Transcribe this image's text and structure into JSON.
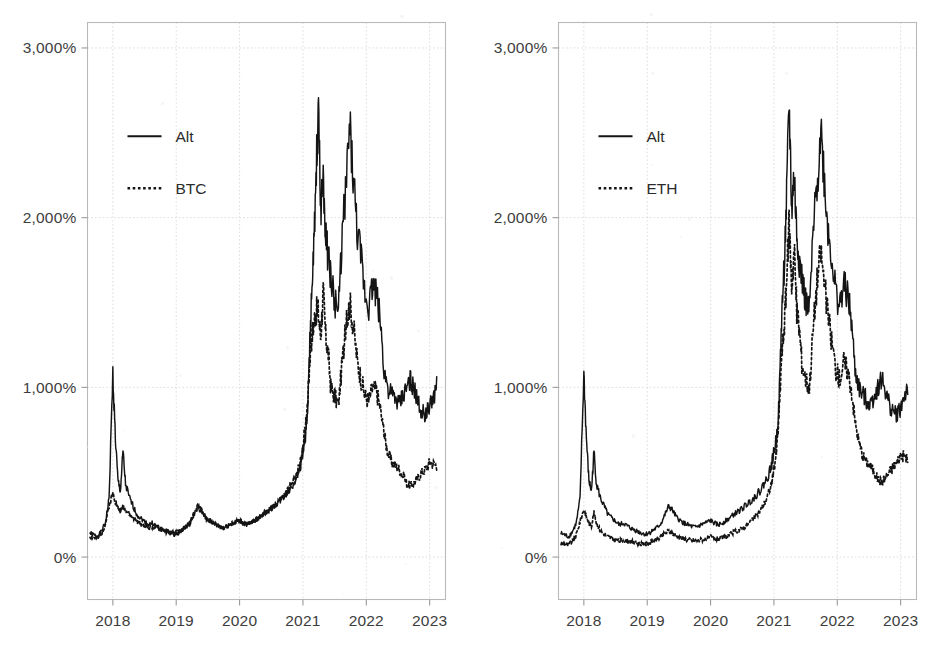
{
  "figure": {
    "background_color": "#ffffff",
    "ink_color": "#141414",
    "grid_color": "#d9d9d9",
    "axis_color": "#b9b9b9",
    "panel_count": 2
  },
  "chart_data": [
    {
      "type": "line",
      "panel": "left",
      "title": "",
      "xlabel": "",
      "ylabel": "",
      "ylim": [
        -250,
        3150
      ],
      "xlim": [
        2017.6,
        2023.25
      ],
      "grid": true,
      "legend_position": "upper-left-inside",
      "ytick_labels": [
        "0%",
        "1,000%",
        "2,000%",
        "3,000%"
      ],
      "ytick_values": [
        0,
        1000,
        2000,
        3000
      ],
      "xtick_labels": [
        "2018",
        "2019",
        "2020",
        "2021",
        "2022",
        "2023"
      ],
      "xtick_values": [
        2018,
        2019,
        2020,
        2021,
        2022,
        2023
      ],
      "legend": [
        {
          "label": "Alt",
          "style": "solid"
        },
        {
          "label": "BTC",
          "style": "dotted"
        }
      ],
      "x": [
        2017.64,
        2017.7,
        2017.76,
        2017.82,
        2017.88,
        2017.94,
        2018.0,
        2018.04,
        2018.08,
        2018.12,
        2018.16,
        2018.2,
        2018.26,
        2018.32,
        2018.38,
        2018.44,
        2018.5,
        2018.56,
        2018.62,
        2018.68,
        2018.74,
        2018.8,
        2018.86,
        2018.92,
        2018.98,
        2019.04,
        2019.1,
        2019.16,
        2019.22,
        2019.28,
        2019.34,
        2019.4,
        2019.46,
        2019.52,
        2019.58,
        2019.64,
        2019.7,
        2019.76,
        2019.82,
        2019.88,
        2019.94,
        2020.0,
        2020.06,
        2020.12,
        2020.18,
        2020.24,
        2020.3,
        2020.36,
        2020.42,
        2020.48,
        2020.54,
        2020.6,
        2020.66,
        2020.72,
        2020.78,
        2020.84,
        2020.9,
        2020.96,
        2021.0,
        2021.04,
        2021.08,
        2021.12,
        2021.16,
        2021.2,
        2021.24,
        2021.28,
        2021.32,
        2021.36,
        2021.4,
        2021.44,
        2021.5,
        2021.56,
        2021.62,
        2021.68,
        2021.74,
        2021.8,
        2021.86,
        2021.92,
        2021.98,
        2022.04,
        2022.1,
        2022.16,
        2022.22,
        2022.28,
        2022.34,
        2022.4,
        2022.46,
        2022.52,
        2022.58,
        2022.64,
        2022.7,
        2022.76,
        2022.82,
        2022.88,
        2022.94,
        2023.0,
        2023.06,
        2023.12,
        2023.18
      ],
      "series": [
        {
          "name": "Alt",
          "style": "solid",
          "values": [
            140,
            130,
            120,
            150,
            200,
            340,
            1080,
            700,
            450,
            390,
            620,
            430,
            350,
            300,
            250,
            230,
            210,
            190,
            200,
            185,
            170,
            160,
            150,
            140,
            135,
            145,
            160,
            175,
            200,
            250,
            300,
            275,
            235,
            215,
            200,
            190,
            180,
            175,
            185,
            195,
            205,
            215,
            200,
            190,
            200,
            215,
            230,
            250,
            265,
            280,
            300,
            320,
            340,
            365,
            390,
            430,
            470,
            540,
            620,
            700,
            900,
            1400,
            1700,
            2100,
            2680,
            2050,
            2250,
            1900,
            1750,
            1650,
            1500,
            1450,
            1900,
            2200,
            2530,
            2200,
            1900,
            1750,
            1550,
            1480,
            1600,
            1550,
            1400,
            1100,
            1000,
            950,
            930,
            900,
            950,
            1000,
            1050,
            980,
            900,
            860,
            840,
            880,
            950,
            1010
          ]
        },
        {
          "name": "BTC",
          "style": "dotted",
          "values": [
            120,
            115,
            110,
            140,
            190,
            300,
            380,
            330,
            290,
            270,
            300,
            280,
            250,
            230,
            210,
            195,
            185,
            175,
            180,
            170,
            165,
            155,
            150,
            145,
            140,
            150,
            165,
            180,
            205,
            255,
            295,
            270,
            235,
            215,
            200,
            190,
            180,
            175,
            185,
            195,
            205,
            215,
            200,
            190,
            200,
            215,
            230,
            250,
            265,
            280,
            300,
            325,
            345,
            370,
            400,
            440,
            490,
            570,
            660,
            760,
            950,
            1250,
            1350,
            1450,
            1450,
            1300,
            1560,
            1300,
            1200,
            1000,
            950,
            900,
            1150,
            1350,
            1500,
            1350,
            1150,
            1050,
            950,
            920,
            1000,
            980,
            880,
            720,
            620,
            560,
            540,
            520,
            480,
            430,
            420,
            440,
            470,
            500,
            520,
            560,
            550,
            540
          ]
        }
      ]
    },
    {
      "type": "line",
      "panel": "right",
      "title": "",
      "xlabel": "",
      "ylabel": "",
      "ylim": [
        -250,
        3150
      ],
      "xlim": [
        2017.6,
        2023.25
      ],
      "grid": true,
      "legend_position": "upper-left-inside",
      "ytick_labels": [
        "0%",
        "1,000%",
        "2,000%",
        "3,000%"
      ],
      "ytick_values": [
        0,
        1000,
        2000,
        3000
      ],
      "xtick_labels": [
        "2018",
        "2019",
        "2020",
        "2021",
        "2022",
        "2023"
      ],
      "xtick_values": [
        2018,
        2019,
        2020,
        2021,
        2022,
        2023
      ],
      "legend": [
        {
          "label": "Alt",
          "style": "solid"
        },
        {
          "label": "ETH",
          "style": "dotted"
        }
      ],
      "x": [
        2017.64,
        2017.7,
        2017.76,
        2017.82,
        2017.88,
        2017.94,
        2018.0,
        2018.04,
        2018.08,
        2018.12,
        2018.16,
        2018.2,
        2018.26,
        2018.32,
        2018.38,
        2018.44,
        2018.5,
        2018.56,
        2018.62,
        2018.68,
        2018.74,
        2018.8,
        2018.86,
        2018.92,
        2018.98,
        2019.04,
        2019.1,
        2019.16,
        2019.22,
        2019.28,
        2019.34,
        2019.4,
        2019.46,
        2019.52,
        2019.58,
        2019.64,
        2019.7,
        2019.76,
        2019.82,
        2019.88,
        2019.94,
        2020.0,
        2020.06,
        2020.12,
        2020.18,
        2020.24,
        2020.3,
        2020.36,
        2020.42,
        2020.48,
        2020.54,
        2020.6,
        2020.66,
        2020.72,
        2020.78,
        2020.84,
        2020.9,
        2020.96,
        2021.0,
        2021.04,
        2021.08,
        2021.12,
        2021.16,
        2021.2,
        2021.24,
        2021.28,
        2021.32,
        2021.36,
        2021.4,
        2021.44,
        2021.5,
        2021.56,
        2021.62,
        2021.68,
        2021.74,
        2021.8,
        2021.86,
        2021.92,
        2021.98,
        2022.04,
        2022.1,
        2022.16,
        2022.22,
        2022.28,
        2022.34,
        2022.4,
        2022.46,
        2022.52,
        2022.58,
        2022.64,
        2022.7,
        2022.76,
        2022.82,
        2022.88,
        2022.94,
        2023.0,
        2023.06,
        2023.12,
        2023.18
      ],
      "series": [
        {
          "name": "Alt",
          "style": "solid",
          "values": [
            140,
            130,
            120,
            150,
            200,
            340,
            1080,
            700,
            450,
            390,
            620,
            430,
            350,
            300,
            250,
            230,
            210,
            190,
            200,
            185,
            170,
            160,
            150,
            140,
            135,
            145,
            160,
            175,
            200,
            250,
            300,
            275,
            235,
            215,
            200,
            190,
            180,
            175,
            185,
            195,
            205,
            215,
            200,
            190,
            200,
            215,
            230,
            250,
            265,
            280,
            300,
            320,
            340,
            365,
            390,
            430,
            470,
            540,
            620,
            700,
            900,
            1400,
            1700,
            2100,
            2680,
            2050,
            2250,
            1900,
            1750,
            1650,
            1500,
            1450,
            1900,
            2200,
            2530,
            2200,
            1900,
            1750,
            1550,
            1480,
            1600,
            1550,
            1400,
            1100,
            1000,
            950,
            930,
            900,
            950,
            1000,
            1050,
            980,
            900,
            860,
            840,
            880,
            950,
            1010
          ]
        },
        {
          "name": "ETH",
          "style": "dotted",
          "values": [
            80,
            75,
            70,
            95,
            130,
            210,
            280,
            240,
            200,
            185,
            260,
            200,
            155,
            135,
            120,
            110,
            100,
            95,
            100,
            95,
            90,
            85,
            80,
            78,
            75,
            85,
            95,
            105,
            120,
            140,
            155,
            140,
            125,
            115,
            108,
            102,
            98,
            95,
            100,
            105,
            110,
            118,
            110,
            105,
            112,
            120,
            130,
            145,
            155,
            165,
            180,
            200,
            220,
            245,
            270,
            310,
            360,
            430,
            520,
            620,
            820,
            1180,
            1350,
            1620,
            1980,
            1600,
            1820,
            1450,
            1350,
            1150,
            1050,
            1000,
            1350,
            1620,
            1800,
            1600,
            1400,
            1250,
            1100,
            1050,
            1150,
            1100,
            1000,
            800,
            680,
            600,
            560,
            540,
            500,
            460,
            440,
            470,
            500,
            530,
            560,
            600,
            590,
            580
          ]
        }
      ]
    }
  ]
}
